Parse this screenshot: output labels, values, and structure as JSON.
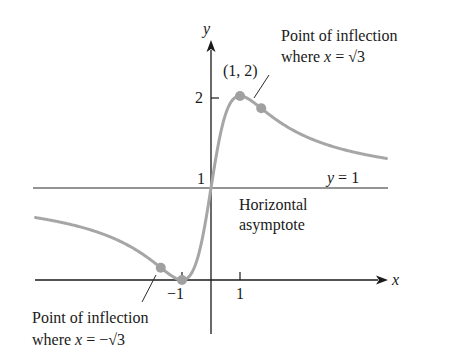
{
  "chart_data": {
    "type": "line",
    "title": "",
    "xlabel": "x",
    "ylabel": "y",
    "function": "y = (x+1)^2 / (x^2+1)",
    "x_range": [
      -6.1,
      6.1
    ],
    "ylim": [
      -0.9,
      2.9
    ],
    "x_ticks": [
      {
        "value": -1,
        "label": "−1"
      },
      {
        "value": 1,
        "label": "1"
      }
    ],
    "y_ticks": [
      {
        "value": 1,
        "label": "1"
      },
      {
        "value": 2,
        "label": "2"
      }
    ],
    "grid": false,
    "legend": null,
    "series": [
      {
        "name": "curve",
        "color": "#a6a6a6",
        "x": [
          -6,
          -5,
          -4,
          -3,
          -2,
          -1.732,
          -1,
          -0.5,
          0,
          0.5,
          1,
          1.732,
          2,
          3,
          4,
          5,
          6
        ],
        "y": [
          0.676,
          0.615,
          0.529,
          0.4,
          0.2,
          0.134,
          0,
          0.2,
          1,
          1.8,
          2,
          1.866,
          1.8,
          1.6,
          1.471,
          1.385,
          1.324
        ]
      }
    ],
    "asymptote": {
      "type": "horizontal",
      "y": 1,
      "label": "y = 1"
    },
    "points": [
      {
        "x": 1,
        "y": 2,
        "label": "(1, 2)",
        "kind": "maximum"
      },
      {
        "x": 1.732,
        "y": 1.866,
        "label": "Point of inflection where x = √3",
        "kind": "inflection"
      },
      {
        "x": -1,
        "y": 0,
        "label": "",
        "kind": "minimum"
      },
      {
        "x": -1.732,
        "y": 0.134,
        "label": "Point of inflection where x = −√3",
        "kind": "inflection"
      }
    ],
    "annotations": [
      "Point of inflection where x = √3",
      "(1, 2)",
      "y = 1",
      "Horizontal asymptote",
      "Point of inflection where x = −√3"
    ]
  },
  "labels": {
    "y_axis": "y",
    "x_axis": "x",
    "tick_y2": "2",
    "tick_y1": "1",
    "tick_xm1": "−1",
    "tick_x1": "1",
    "max_point": "(1, 2)",
    "asymptote_eq_var": "y",
    "asymptote_eq_rest": " = 1",
    "asymptote_line1": "Horizontal",
    "asymptote_line2": "asymptote",
    "inflection_right_line1": "Point of inflection",
    "inflection_right_where": "where ",
    "inflection_right_var": "x",
    "inflection_right_rest": " = √3",
    "inflection_left_line1": "Point of inflection",
    "inflection_left_where": "where ",
    "inflection_left_var": "x",
    "inflection_left_rest": " = −√3"
  },
  "colors": {
    "curve": "#a6a6a6",
    "point": "#a0a0a0",
    "axis": "#1a1a1a"
  }
}
